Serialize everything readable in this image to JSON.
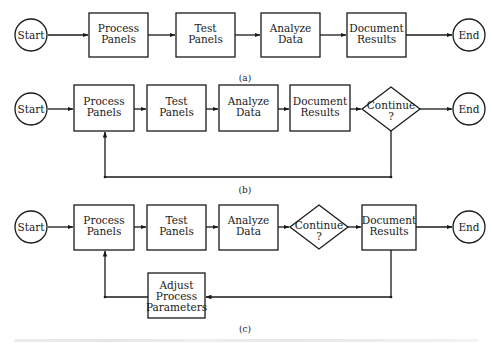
{
  "figure": {
    "colors": {
      "line": "#1a1a1a",
      "background": "#ffffff"
    },
    "panels": [
      {
        "id": "a",
        "caption": "(a)",
        "nodes": [
          {
            "id": "start",
            "shape": "circle",
            "lines": [
              "Start"
            ]
          },
          {
            "id": "process",
            "shape": "box",
            "lines": [
              "Process",
              "Panels"
            ]
          },
          {
            "id": "test",
            "shape": "box",
            "lines": [
              "Test",
              "Panels"
            ]
          },
          {
            "id": "analyze",
            "shape": "box",
            "lines": [
              "Analyze",
              "Data"
            ]
          },
          {
            "id": "document",
            "shape": "box",
            "lines": [
              "Document",
              "Results"
            ]
          },
          {
            "id": "end",
            "shape": "circle",
            "lines": [
              "End"
            ]
          }
        ],
        "edges": [
          [
            "start",
            "process"
          ],
          [
            "process",
            "test"
          ],
          [
            "test",
            "analyze"
          ],
          [
            "analyze",
            "document"
          ],
          [
            "document",
            "end"
          ]
        ]
      },
      {
        "id": "b",
        "caption": "(b)",
        "nodes": [
          {
            "id": "start",
            "shape": "circle",
            "lines": [
              "Start"
            ]
          },
          {
            "id": "process",
            "shape": "box",
            "lines": [
              "Process",
              "Panels"
            ]
          },
          {
            "id": "test",
            "shape": "box",
            "lines": [
              "Test",
              "Panels"
            ]
          },
          {
            "id": "analyze",
            "shape": "box",
            "lines": [
              "Analyze",
              "Data"
            ]
          },
          {
            "id": "document",
            "shape": "box",
            "lines": [
              "Document",
              "Results"
            ]
          },
          {
            "id": "continue",
            "shape": "diamond",
            "lines": [
              "Continue",
              "?"
            ]
          },
          {
            "id": "end",
            "shape": "circle",
            "lines": [
              "End"
            ]
          }
        ],
        "edges": [
          [
            "start",
            "process"
          ],
          [
            "process",
            "test"
          ],
          [
            "test",
            "analyze"
          ],
          [
            "analyze",
            "document"
          ],
          [
            "document",
            "continue"
          ],
          [
            "continue",
            "end"
          ],
          [
            "continue",
            "process"
          ]
        ]
      },
      {
        "id": "c",
        "caption": "(c)",
        "nodes": [
          {
            "id": "start",
            "shape": "circle",
            "lines": [
              "Start"
            ]
          },
          {
            "id": "process",
            "shape": "box",
            "lines": [
              "Process",
              "Panels"
            ]
          },
          {
            "id": "test",
            "shape": "box",
            "lines": [
              "Test",
              "Panels"
            ]
          },
          {
            "id": "analyze",
            "shape": "box",
            "lines": [
              "Analyze",
              "Data"
            ]
          },
          {
            "id": "continue",
            "shape": "diamond",
            "lines": [
              "Continue",
              "?"
            ]
          },
          {
            "id": "document",
            "shape": "box",
            "lines": [
              "Document",
              "Results"
            ]
          },
          {
            "id": "end",
            "shape": "circle",
            "lines": [
              "End"
            ]
          },
          {
            "id": "adjust",
            "shape": "box",
            "lines": [
              "Adjust",
              "Process",
              "Parameters"
            ]
          }
        ],
        "edges": [
          [
            "start",
            "process"
          ],
          [
            "process",
            "test"
          ],
          [
            "test",
            "analyze"
          ],
          [
            "analyze",
            "continue"
          ],
          [
            "continue",
            "document"
          ],
          [
            "document",
            "end"
          ],
          [
            "document",
            "adjust"
          ],
          [
            "adjust",
            "process"
          ]
        ]
      }
    ]
  }
}
